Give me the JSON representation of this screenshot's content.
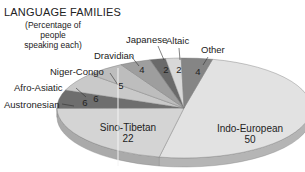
{
  "chart_data": {
    "type": "pie",
    "title": "LANGUAGE FAMILIES",
    "subtitle": "(Percentage of people speaking each)",
    "categories": [
      "Indo-European",
      "Sino-Tibetan",
      "Austronesian",
      "Afro-Asiatic",
      "Niger-Congo",
      "Dravidian",
      "Japanese",
      "Altaic",
      "Other"
    ],
    "values": [
      50,
      22,
      6,
      6,
      5,
      4,
      2,
      2,
      4
    ],
    "colors": [
      "#e2e2e2",
      "#d4d4d4",
      "#6e6e6e",
      "#c9c9c9",
      "#bdbdbd",
      "#9e9e9e",
      "#6a6a6a",
      "#d8d8d8",
      "#858585"
    ],
    "style": "3d-tilted-pie",
    "legend": "callout labels"
  },
  "title": "LANGUAGE FAMILIES",
  "subtitle_line1": "(Percentage of people",
  "subtitle_line2": "speaking each)"
}
